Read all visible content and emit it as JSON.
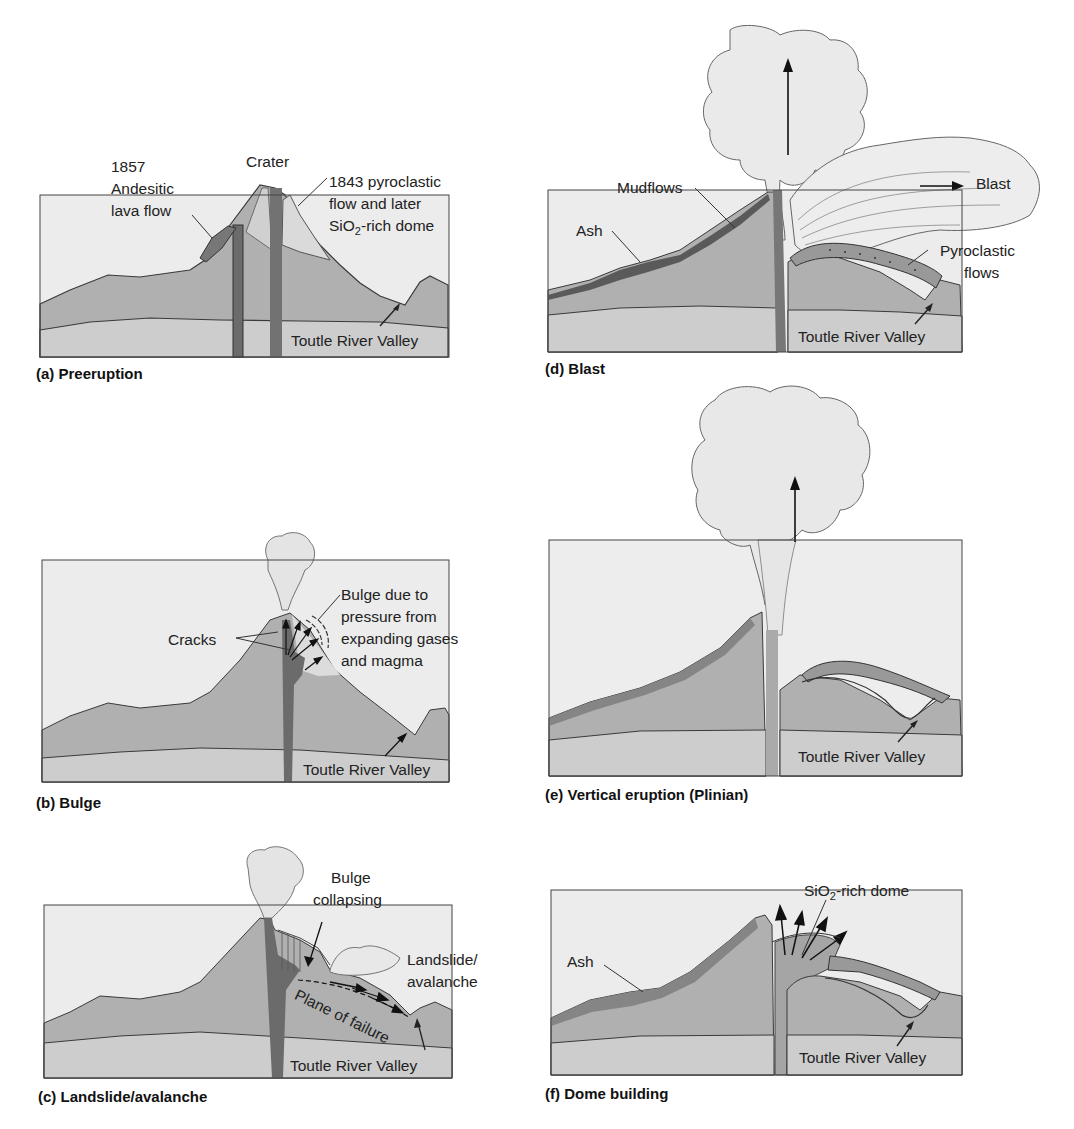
{
  "figure": {
    "panels": [
      {
        "id": "a",
        "caption": "(a) Preeruption",
        "labels": {
          "lava_year": "1857",
          "lava_line1": "Andesitic",
          "lava_line2": "lava flow",
          "crater": "Crater",
          "pyro_line1": "1843 pyroclastic",
          "pyro_line2": "flow and later",
          "pyro_line3_pre": "SiO",
          "pyro_line3_sub": "2",
          "pyro_line3_post": "-rich dome",
          "valley": "Toutle River Valley"
        }
      },
      {
        "id": "b",
        "caption": "(b) Bulge",
        "labels": {
          "cracks": "Cracks",
          "bulge_line1": "Bulge due to",
          "bulge_line2": "pressure from",
          "bulge_line3": "expanding gases",
          "bulge_line4": "and magma",
          "valley": "Toutle River Valley"
        }
      },
      {
        "id": "c",
        "caption": "(c) Landslide/avalanche",
        "labels": {
          "bulge_line1": "Bulge",
          "bulge_line2": "collapsing",
          "landslide_line1": "Landslide/",
          "landslide_line2": "avalanche",
          "plane": "Plane of failure",
          "valley": "Toutle River Valley"
        }
      },
      {
        "id": "d",
        "caption": "(d) Blast",
        "labels": {
          "mudflows": "Mudflows",
          "ash": "Ash",
          "blast": "Blast",
          "pyro_line1": "Pyroclastic",
          "pyro_line2": "flows",
          "valley": "Toutle River Valley"
        }
      },
      {
        "id": "e",
        "caption": "(e) Vertical eruption (Plinian)",
        "labels": {
          "valley": "Toutle River Valley"
        }
      },
      {
        "id": "f",
        "caption": "(f) Dome building",
        "labels": {
          "dome_pre": "SiO",
          "dome_sub": "2",
          "dome_post": "-rich dome",
          "ash": "Ash",
          "valley": "Toutle River Valley"
        }
      }
    ]
  },
  "colors": {
    "sky": "#ececec",
    "mountain": "#b3b3b3",
    "basement": "#cdcdcd",
    "conduit": "#6e6e6e",
    "ash_layer": "#8a8a8a",
    "cloud": "#eeeeee",
    "line": "#3a3a3a"
  }
}
